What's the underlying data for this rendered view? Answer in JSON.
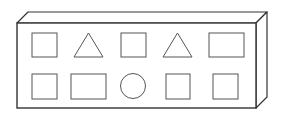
{
  "diagram": {
    "colors": {
      "stroke": "#333333",
      "fill": "#ffffff",
      "shape_stroke": "#555555"
    },
    "box": {
      "front": {
        "x": 17,
        "y": 23,
        "width": 239,
        "height": 85
      },
      "depth_dx": 11,
      "depth_dy": -11
    },
    "rows": [
      {
        "shapes": [
          {
            "type": "square",
            "x": 32,
            "y": 33,
            "w": 25,
            "h": 24
          },
          {
            "type": "triangle",
            "x": 74,
            "y": 33,
            "w": 29,
            "h": 24
          },
          {
            "type": "square",
            "x": 121,
            "y": 33,
            "w": 25,
            "h": 24
          },
          {
            "type": "triangle",
            "x": 163,
            "y": 33,
            "w": 29,
            "h": 24
          },
          {
            "type": "rectangle",
            "x": 209,
            "y": 33,
            "w": 35,
            "h": 24
          }
        ]
      },
      {
        "shapes": [
          {
            "type": "square",
            "x": 32,
            "y": 74,
            "w": 25,
            "h": 25
          },
          {
            "type": "rectangle",
            "x": 71,
            "y": 74,
            "w": 35,
            "h": 25
          },
          {
            "type": "circle",
            "cx": 133,
            "cy": 86,
            "r": 12.5
          },
          {
            "type": "square",
            "x": 166,
            "y": 74,
            "w": 24,
            "h": 25
          },
          {
            "type": "square",
            "x": 213,
            "y": 74,
            "w": 25,
            "h": 25
          }
        ]
      }
    ]
  }
}
